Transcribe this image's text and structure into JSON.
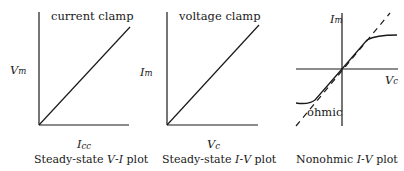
{
  "figure": {
    "panels": [
      {
        "id": "steady-state-vi",
        "annotation": "current clamp",
        "y_axis": {
          "symbol": "V",
          "subscript": "m"
        },
        "x_axis": {
          "symbol": "I",
          "subscript": "cc"
        },
        "caption": {
          "pre": "Steady-state ",
          "var1": "V",
          "dash": "-",
          "var2": "I",
          "post": " plot"
        },
        "curve": "linear through origin"
      },
      {
        "id": "steady-state-iv",
        "annotation": "voltage clamp",
        "y_axis": {
          "symbol": "I",
          "subscript": "m"
        },
        "x_axis": {
          "symbol": "V",
          "subscript": "c"
        },
        "caption": {
          "pre": "Steady-state ",
          "var1": "I",
          "dash": "-",
          "var2": "V",
          "post": " plot"
        },
        "curve": "linear through origin"
      },
      {
        "id": "nonohmic-iv",
        "annotation": "ohmic",
        "y_axis": {
          "symbol": "I",
          "subscript": "m"
        },
        "x_axis": {
          "symbol": "V",
          "subscript": "c"
        },
        "caption": {
          "pre": "Nonohmic ",
          "var1": "I",
          "dash": "-",
          "var2": "V",
          "post": " plot"
        },
        "curve": "sigmoid saturating curve with dashed ohmic reference line"
      }
    ]
  },
  "colors": {
    "ink": "#1a1a1a",
    "background": "#ffffff"
  }
}
